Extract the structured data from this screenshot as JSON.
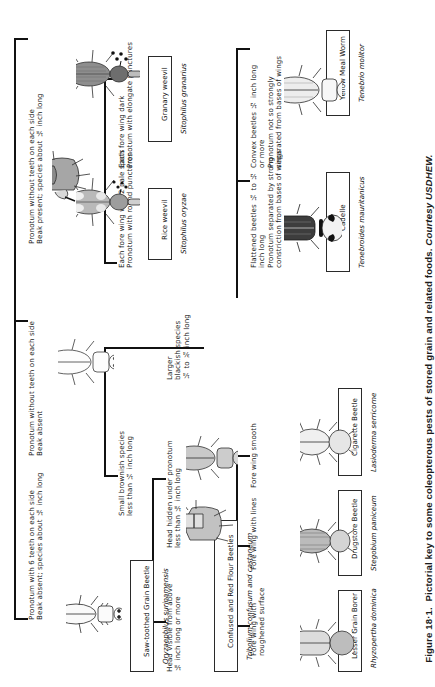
{
  "figure": {
    "caption_label": "Figure 18·1.",
    "caption_text": "Pictorial key to some coleopterous pests of stored grain and related foods.",
    "caption_credit": "Courtesy USDHEW.",
    "orientation": "text rotated 90 degrees counter-clockwise",
    "ink_color": "#1a1a1a",
    "background_color": "#ffffff"
  },
  "key": {
    "couplets": [
      {
        "id": "c1a",
        "text": "Pronotum with 6 teeth on each side\nBeak absent; species about ⅛ inch long"
      },
      {
        "id": "c1b",
        "text": "Pronotum without teeth on each side\nBeak present; species about ⅛ inch long"
      },
      {
        "id": "c1c",
        "text": "Pronotum without teeth on each side\nBeak absent"
      },
      {
        "id": "c2a",
        "text": "Each fore wing with 2 pale spots\nPronotum with round punctures"
      },
      {
        "id": "c2b",
        "text": "Each fore wing dark\nPronotum with elongate punctures"
      },
      {
        "id": "c3a",
        "text": "Small brownish species\nless than ¼ inch long"
      },
      {
        "id": "c3b",
        "text": "Larger\nblackish species\n¼ to ¾ inch long"
      },
      {
        "id": "c4a",
        "text": "Head visible from above\n⅛ inch long or more"
      },
      {
        "id": "c4b",
        "text": "Head hidden under pronotum\nless than ⅛ inch long"
      },
      {
        "id": "c5a",
        "text": "Fore wing with\nroughened surface"
      },
      {
        "id": "c5b",
        "text": "Fore wing with lines"
      },
      {
        "id": "c5c",
        "text": "Fore wing smooth"
      },
      {
        "id": "c6a",
        "text": "Flattened beetles ¼ to ½\ninch long\nPronotum separated by strong\nconstriction from bases of wings"
      },
      {
        "id": "c6b",
        "text": "Convex beetles ½ inch long\nor more\nPronotum not so strongly\nseparated from bases of wings"
      }
    ],
    "species": [
      {
        "id": "s-sawtoothed",
        "common": "Saw-toothed Grain Beetle",
        "scientific": "Oryzaephilus surinamensis"
      },
      {
        "id": "s-riceweevil",
        "common": "Rice weevil",
        "scientific": "Sitophilus oryzae"
      },
      {
        "id": "s-granaryweevil",
        "common": "Granary weevil",
        "scientific": "Sitophilus granarius"
      },
      {
        "id": "s-flourbeetles",
        "common": "Confused and Red Flour Beetles",
        "scientific": "Tribolium confusum and castaneum"
      },
      {
        "id": "s-lessergrainborer",
        "common": "Lesser Grain Borer",
        "scientific": "Rhyzopertha dominica"
      },
      {
        "id": "s-drugstore",
        "common": "Drugstore Beetle",
        "scientific": "Stegobium paniceum"
      },
      {
        "id": "s-cigarette",
        "common": "Cigarette Beetle",
        "scientific": "Lasioderma serricorne"
      },
      {
        "id": "s-cadelle",
        "common": "Cadelle",
        "scientific": "Tenebroides mauritanicus"
      },
      {
        "id": "s-mealworm",
        "common": "Yellow Meal Worm",
        "scientific": "Tenebrio molitor"
      }
    ]
  }
}
